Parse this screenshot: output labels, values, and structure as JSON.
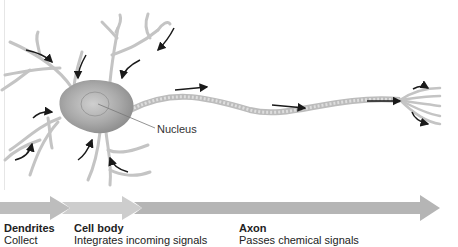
{
  "diagram": {
    "nucleus_label": "Nucleus",
    "regions": [
      {
        "title": "Dendrites",
        "description": "Collect"
      },
      {
        "title": "Cell body",
        "description": "Integrates incoming signals"
      },
      {
        "title": "Axon",
        "description": "Passes chemical signals"
      }
    ],
    "colors": {
      "cell_fill": "#b8b8b8",
      "cell_dark": "#8e8e8e",
      "dendrite": "#c4c4c4",
      "axon": "#cfcfcf",
      "arrow_ink": "#1a1a1a",
      "band_dendrites": "#bdbdbd",
      "band_cell_body": "#cdcdcd",
      "band_axon": "#b5b5b5"
    }
  }
}
